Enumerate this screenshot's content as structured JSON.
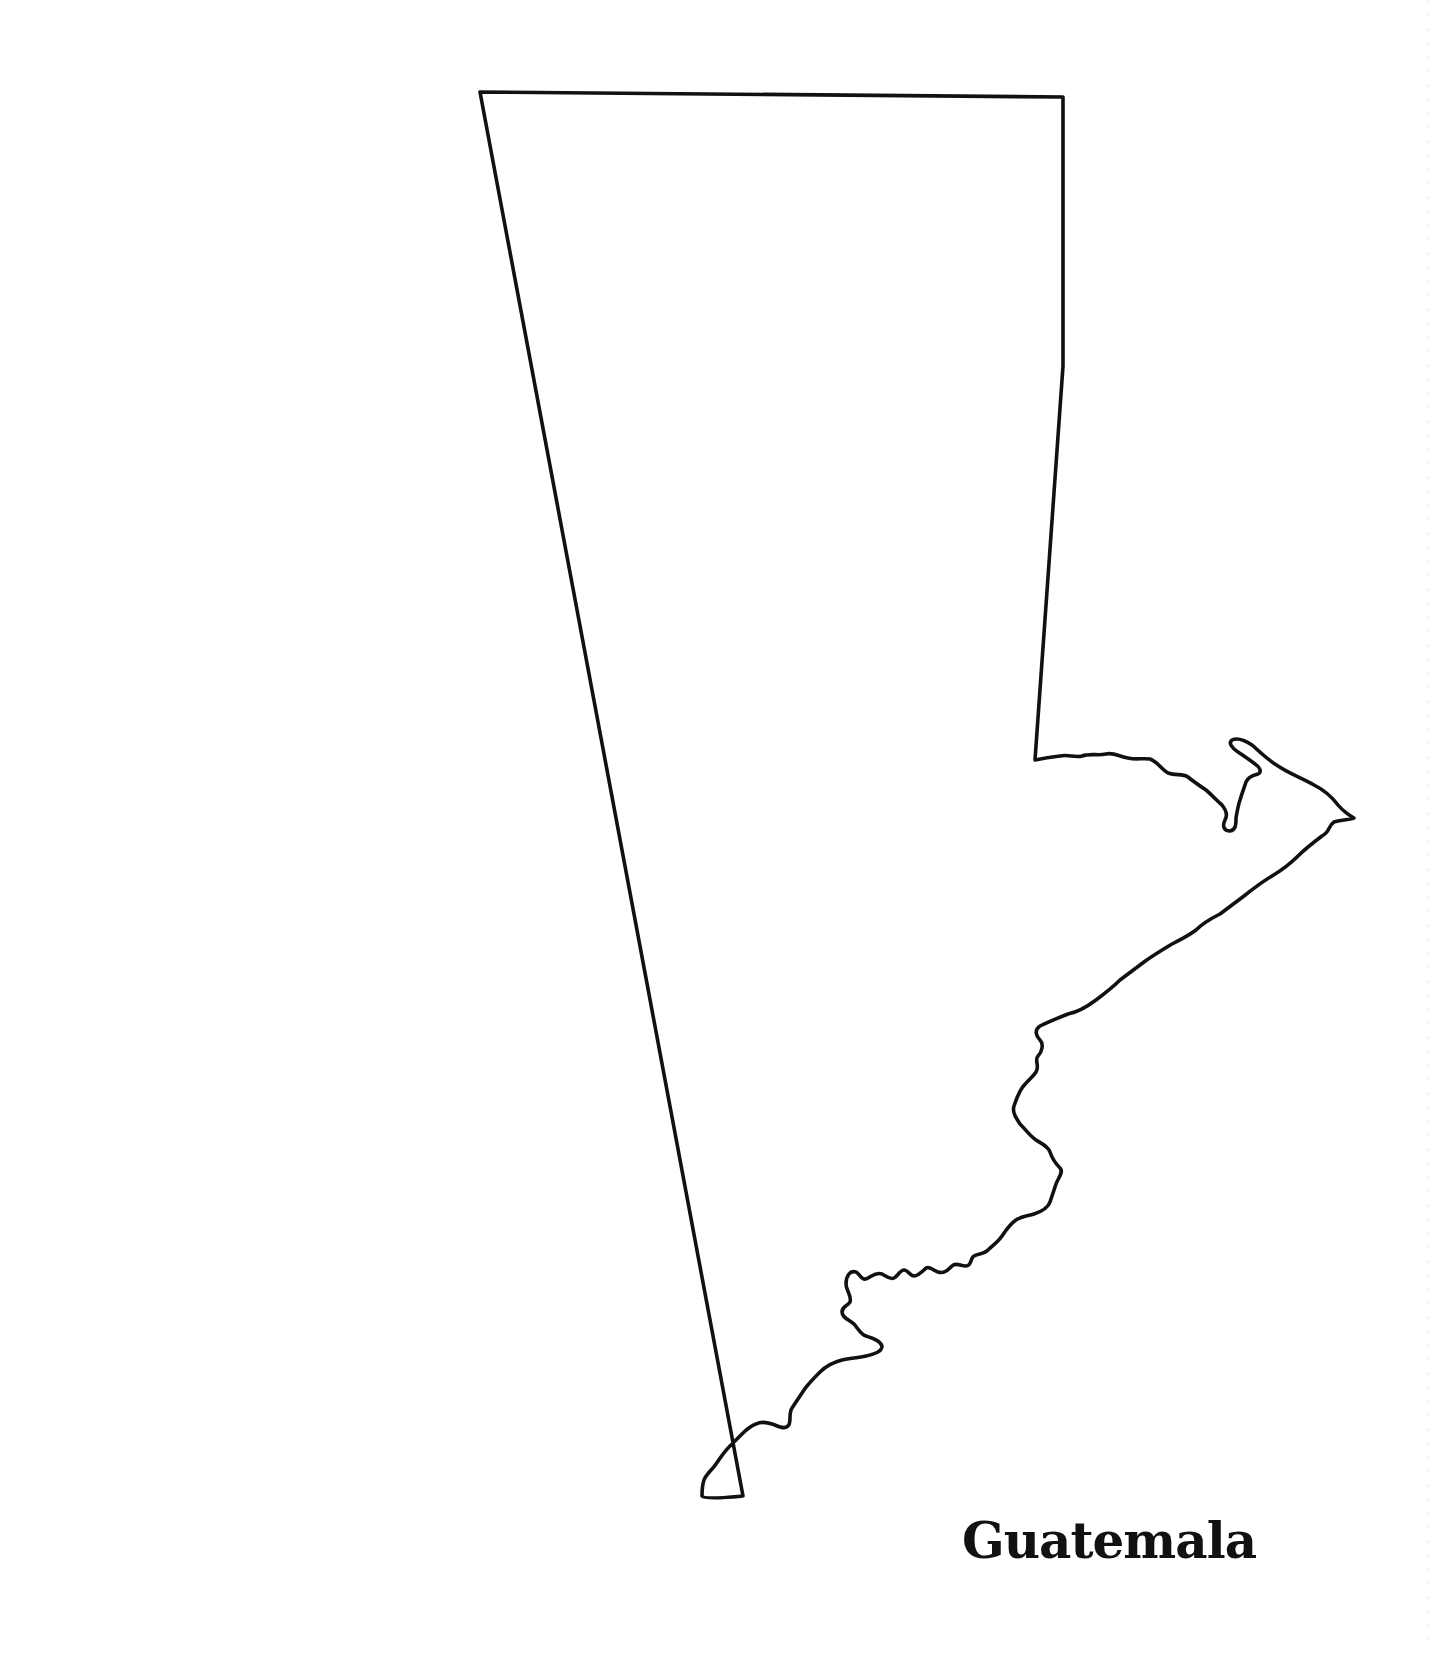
{
  "map": {
    "title": "Guatemala",
    "type": "outline-map",
    "outline_color": "#111111",
    "background_color": "#ffffff",
    "features": [
      "Petén rectangle (northern straight borders)",
      "Usumacinta river border (northwest)",
      "Bay of Amatique / Punta de Manabique peninsula (northeast)",
      "Pacific coastline (south)",
      "Honduras and El Salvador river borders (southeast)"
    ]
  }
}
